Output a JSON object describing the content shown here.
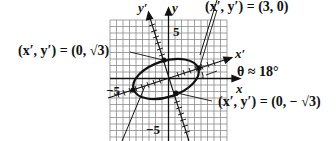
{
  "diagram": {
    "type": "rotated-ellipse-graph",
    "axes": {
      "x_label": "x",
      "y_label": "y",
      "x_prime_label": "x′",
      "y_prime_label": "y′",
      "tick_pos": "5",
      "tick_neg_x": "−5",
      "tick_neg_y": "−5"
    },
    "angle_label": "θ ≈ 18°",
    "annotations": [
      {
        "id": "pt_top",
        "text": "(x′, y′) = (0, √3)"
      },
      {
        "id": "pt_right",
        "text": "(x′, y′) = (3, 0)"
      },
      {
        "id": "pt_bottom",
        "text": "(x′, y′) = (0, − √3)"
      }
    ],
    "colors": {
      "ink": "#111111",
      "grid": "#8a8a8a",
      "background": "#ffffff"
    }
  }
}
